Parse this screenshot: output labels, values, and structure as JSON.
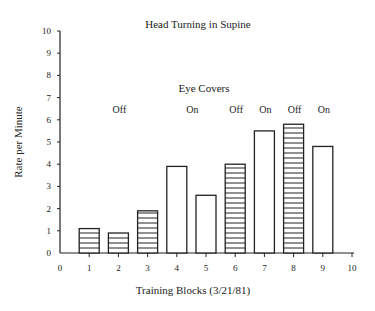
{
  "chart_data": {
    "type": "bar",
    "title": "Head Turning in Supine",
    "xlabel": "Training Blocks (3/21/81)",
    "ylabel": "Rate per Minute",
    "xlim": [
      0,
      10
    ],
    "ylim": [
      0,
      10
    ],
    "x_ticks": [
      0,
      1,
      2,
      3,
      4,
      5,
      6,
      7,
      8,
      9,
      10
    ],
    "y_ticks": [
      0,
      1,
      2,
      3,
      4,
      5,
      6,
      7,
      8,
      9,
      10
    ],
    "grid": false,
    "categories": [
      1,
      2,
      3,
      4,
      5,
      6,
      7,
      8,
      9
    ],
    "values": [
      1.1,
      0.9,
      1.9,
      3.9,
      2.6,
      4.0,
      5.5,
      5.8,
      4.8
    ],
    "bar_fill": [
      "striped",
      "striped",
      "striped",
      "open",
      "open",
      "striped",
      "open",
      "striped",
      "open"
    ],
    "annotation_header": "Eye Covers",
    "annotations": [
      {
        "label": "Off",
        "x": 2
      },
      {
        "label": "On",
        "x": 4.5
      },
      {
        "label": "Off",
        "x": 6
      },
      {
        "label": "On",
        "x": 7
      },
      {
        "label": "Off",
        "x": 8
      },
      {
        "label": "On",
        "x": 9
      }
    ],
    "legend": "striped bars = Eye Covers Off; open bars = Eye Covers On"
  }
}
